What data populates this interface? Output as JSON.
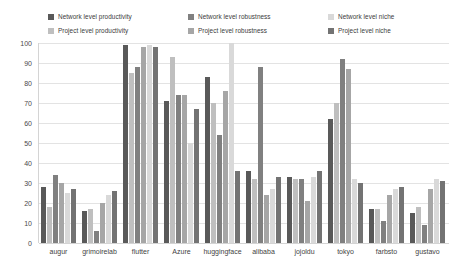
{
  "chart_data": {
    "type": "bar",
    "title": "",
    "xlabel": "",
    "ylabel": "",
    "ylim": [
      0,
      100
    ],
    "yticks": [
      0,
      10,
      20,
      30,
      40,
      50,
      60,
      70,
      80,
      90,
      100
    ],
    "grid": true,
    "legend_position": "top",
    "categories": [
      "augur",
      "grimoirelab",
      "flutter",
      "Azure",
      "huggingface",
      "alibaba",
      "jojoldu",
      "tokyo",
      "farbsto",
      "gustavo"
    ],
    "series": [
      {
        "name": "Network level productivity",
        "color": "#595959",
        "values": [
          28,
          16,
          99,
          71,
          83,
          36,
          33,
          62,
          17,
          15
        ]
      },
      {
        "name": "Project level productivity",
        "color": "#bfbfbf",
        "values": [
          18,
          17,
          85,
          93,
          70,
          32,
          32,
          70,
          17,
          18
        ]
      },
      {
        "name": "Network level robustness",
        "color": "#808080",
        "values": [
          34,
          6,
          88,
          74,
          54,
          88,
          32,
          92,
          11,
          9
        ]
      },
      {
        "name": "Project level robustness",
        "color": "#a6a6a6",
        "values": [
          30,
          20,
          98,
          74,
          76,
          24,
          21,
          87,
          24,
          27
        ]
      },
      {
        "name": "Network level niche",
        "color": "#d9d9d9",
        "values": [
          25,
          24,
          99,
          50,
          100,
          27,
          33,
          32,
          27,
          32
        ]
      },
      {
        "name": "Project level niche",
        "color": "#737373",
        "values": [
          27,
          26,
          98,
          67,
          36,
          33,
          36,
          30,
          28,
          31
        ]
      }
    ]
  },
  "legend": {
    "items": [
      {
        "label": "Network level productivity",
        "swatch": "#595959"
      },
      {
        "label": "Project level productivity",
        "swatch": "#bfbfbf"
      },
      {
        "label": "Network level robustness",
        "swatch": "#808080"
      },
      {
        "label": "Project level robustness",
        "swatch": "#a6a6a6"
      },
      {
        "label": "Network level niche",
        "swatch": "#d9d9d9"
      },
      {
        "label": "Project level niche",
        "swatch": "#737373"
      }
    ]
  }
}
